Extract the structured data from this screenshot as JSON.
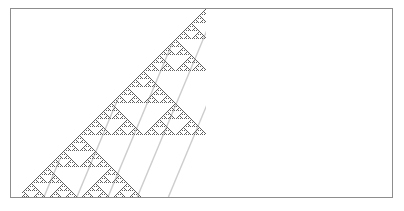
{
  "figure": {
    "title": "",
    "caption": "",
    "width": 404,
    "height": 211,
    "background_color": "#ffffff"
  },
  "frame": {
    "name": "plot-frame",
    "x": 10,
    "y": 8,
    "width": 383,
    "height": 190,
    "border_color": "#8d8d8d",
    "border_width": 1,
    "fill_color": "#ffffff"
  },
  "chart_data": {
    "type": "heatmap",
    "title": "",
    "subtitle": "",
    "xlabel": "",
    "ylabel": "",
    "description": "Elementary cellular automaton Rule 90 evolution from a single active cell, drawn as a right triangle with the apex at the top right and the hypotenuse descending to the lower left; produces a Sierpinski gasket texture with white triangular voids.",
    "rule": 90,
    "rule_binary": "01011010",
    "initial_condition": "single-cell",
    "cell_size": 1,
    "generations": 187,
    "columns": 195,
    "grid": false,
    "legend": null,
    "triangle": {
      "apex_x": 205,
      "apex_y": 9,
      "base_left_x": 22,
      "base_right_x": 205,
      "base_y": 196,
      "right_edge_x": 205
    },
    "colors": {
      "active_cell": "#5f5f5f",
      "inactive_cell": "#ffffff",
      "streak": "#8a8a8a",
      "void": "#ffffff"
    },
    "xlim": [
      0,
      195
    ],
    "ylim": [
      0,
      187
    ]
  },
  "annotations": {
    "empty_region_label": "",
    "axis_ticks": [],
    "legend_entries": []
  }
}
